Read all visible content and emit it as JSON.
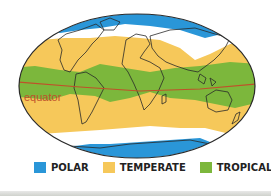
{
  "map": {
    "title": "Climate zones world map",
    "equator_label": "equator",
    "equator_color": "#c0502a",
    "outline_color": "#2a2a2a"
  },
  "legend": {
    "items": [
      {
        "label": "POLAR",
        "color": "#2a96d8"
      },
      {
        "label": "TEMPERATE",
        "color": "#f6c85a"
      },
      {
        "label": "TROPICAL",
        "color": "#7cb73c"
      }
    ]
  }
}
